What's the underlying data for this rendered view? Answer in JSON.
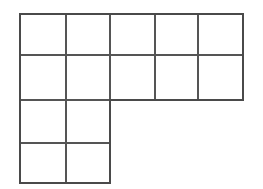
{
  "figure": {
    "background_color": "#ffffff",
    "line_color": "#555555",
    "outline_color": "#4a4a4a",
    "cell_fill_color": "#ffffff",
    "cell_count": 14,
    "column_count": 5,
    "row_count": 4
  },
  "chart_data": {
    "type": "table",
    "xlabel": "",
    "ylabel": "",
    "grid": true,
    "legend": "none",
    "columns": 5,
    "rows": 4,
    "x_edges": [
      20,
      66,
      110,
      155,
      198,
      243
    ],
    "y_edges": [
      14,
      55,
      100,
      143,
      183
    ],
    "categories": [
      "col1",
      "col2",
      "col3",
      "col4",
      "col5"
    ],
    "values": [
      4,
      4,
      2,
      2,
      2
    ],
    "occupancy": [
      [
        1,
        1,
        1,
        1,
        1
      ],
      [
        1,
        1,
        1,
        1,
        1
      ],
      [
        1,
        1,
        0,
        0,
        0
      ],
      [
        1,
        1,
        0,
        0,
        0
      ]
    ],
    "cells": [
      {
        "row": 0,
        "col": 0,
        "x": 20,
        "y": 14,
        "w": 46,
        "h": 41
      },
      {
        "row": 0,
        "col": 1,
        "x": 66,
        "y": 14,
        "w": 44,
        "h": 41
      },
      {
        "row": 0,
        "col": 2,
        "x": 110,
        "y": 14,
        "w": 45,
        "h": 41
      },
      {
        "row": 0,
        "col": 3,
        "x": 155,
        "y": 14,
        "w": 43,
        "h": 41
      },
      {
        "row": 0,
        "col": 4,
        "x": 198,
        "y": 14,
        "w": 45,
        "h": 41
      },
      {
        "row": 1,
        "col": 0,
        "x": 20,
        "y": 55,
        "w": 46,
        "h": 45
      },
      {
        "row": 1,
        "col": 1,
        "x": 66,
        "y": 55,
        "w": 44,
        "h": 45
      },
      {
        "row": 1,
        "col": 2,
        "x": 110,
        "y": 55,
        "w": 45,
        "h": 45
      },
      {
        "row": 1,
        "col": 3,
        "x": 155,
        "y": 55,
        "w": 43,
        "h": 45
      },
      {
        "row": 1,
        "col": 4,
        "x": 198,
        "y": 55,
        "w": 45,
        "h": 45
      },
      {
        "row": 2,
        "col": 0,
        "x": 20,
        "y": 100,
        "w": 46,
        "h": 43
      },
      {
        "row": 2,
        "col": 1,
        "x": 66,
        "y": 100,
        "w": 44,
        "h": 43
      },
      {
        "row": 3,
        "col": 0,
        "x": 20,
        "y": 143,
        "w": 46,
        "h": 40
      },
      {
        "row": 3,
        "col": 1,
        "x": 66,
        "y": 143,
        "w": 44,
        "h": 40
      }
    ],
    "outline_path": "M 20 14 L 243 14 L 243 100 L 110 100 L 110 183 L 20 183 Z",
    "interior_lines": [
      {
        "orientation": "horizontal",
        "x1": 20,
        "y1": 55,
        "x2": 243,
        "y2": 55
      },
      {
        "orientation": "horizontal",
        "x1": 20,
        "y1": 100,
        "x2": 243,
        "y2": 100
      },
      {
        "orientation": "horizontal",
        "x1": 20,
        "y1": 143,
        "x2": 110,
        "y2": 143
      },
      {
        "orientation": "vertical",
        "x1": 66,
        "y1": 14,
        "x2": 66,
        "y2": 183
      },
      {
        "orientation": "vertical",
        "x1": 110,
        "y1": 14,
        "x2": 110,
        "y2": 183
      },
      {
        "orientation": "vertical",
        "x1": 155,
        "y1": 14,
        "x2": 155,
        "y2": 100
      },
      {
        "orientation": "vertical",
        "x1": 198,
        "y1": 14,
        "x2": 198,
        "y2": 100
      }
    ]
  }
}
